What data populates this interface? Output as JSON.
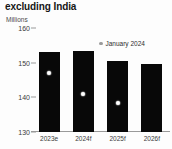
{
  "chart_data": {
    "type": "bar",
    "title": "excluding India",
    "subtitle": "",
    "units_label": "Millions",
    "xlabel": "",
    "ylabel": "",
    "ylim": [
      130,
      160
    ],
    "yticks": [
      130,
      140,
      150,
      160
    ],
    "ytick_labels": [
      "130",
      "140",
      "150",
      "160"
    ],
    "grid": false,
    "categories": [
      "2023e",
      "2024f",
      "2025f",
      "2026f"
    ],
    "series": [
      {
        "name": "",
        "type": "bar",
        "color": "#080808",
        "values": [
          153.2,
          153.5,
          150.6,
          149.5
        ]
      },
      {
        "name": "January 2024",
        "type": "scatter",
        "color": "#ffffff",
        "legend_swatch_color": "#9b9b9b",
        "values": [
          147.0,
          140.9,
          138.3,
          null
        ]
      }
    ],
    "legend": {
      "position": "top-right",
      "entries": [
        {
          "label": "January 2024",
          "marker": "dot",
          "color": "#9b9b9b"
        }
      ]
    },
    "annotations": []
  }
}
